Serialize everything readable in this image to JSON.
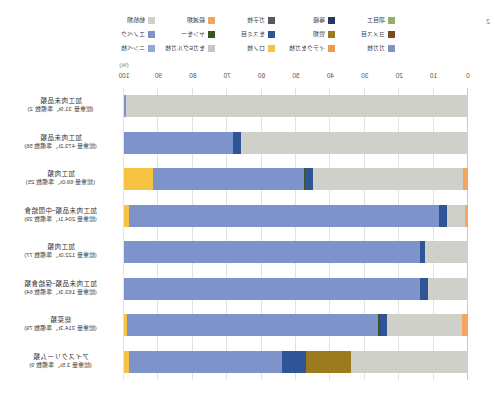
{
  "figure": {
    "corner_number": "2",
    "unit": "(%)"
  },
  "chart_data": {
    "type": "bar",
    "title": "",
    "xlabel": "(%)",
    "ylabel": "",
    "xlim": [
      0,
      100
    ],
    "grid": true,
    "stacked": true,
    "orientation": "horizontal",
    "legend_position": "top",
    "axis_ticks": [
      "0",
      "10",
      "20",
      "30",
      "40",
      "50",
      "60",
      "70",
      "80",
      "90",
      "100"
    ],
    "series": [
      {
        "name": "項目エ",
        "color": "#8fb36a",
        "values": [
          0.0,
          0.0,
          0.0,
          0.0,
          0.0,
          0.0,
          0.0,
          0.0
        ]
      },
      {
        "name": "等級",
        "color": "#1f3864",
        "values": [
          0.0,
          0.0,
          0.0,
          0.0,
          0.0,
          0.0,
          0.0,
          0.0
        ]
      },
      {
        "name": "ガ子枝",
        "color": "#595959",
        "values": [
          0.0,
          0.0,
          0.0,
          0.0,
          0.0,
          0.0,
          0.0,
          0.0
        ]
      },
      {
        "name": "殺滅類",
        "color": "#f4a45e",
        "values": [
          0.0,
          0.0,
          1.5,
          1.0,
          0.0,
          0.0,
          1.6,
          0.0
        ]
      },
      {
        "name": "動植類",
        "color": "#d0d0ca",
        "values": [
          99.4,
          66.0,
          43.5,
          5.0,
          12.5,
          11.5,
          22.0,
          34.0
        ]
      },
      {
        "name": "ヨメス目",
        "color": "#7b4b22",
        "values": [
          0.0,
          0.0,
          0.0,
          0.0,
          0.0,
          0.0,
          0.0,
          0.0
        ]
      },
      {
        "name": "管類",
        "color": "#9c7a1e",
        "values": [
          0.0,
          0.0,
          0.0,
          0.0,
          0.0,
          0.0,
          0.0,
          13.0
        ]
      },
      {
        "name": "をスミ目",
        "color": "#2f5597",
        "values": [
          0.0,
          2.2,
          2.3,
          2.5,
          1.5,
          2.5,
          2.0,
          7.0
        ]
      },
      {
        "name": "ヤンをー",
        "color": "#375623",
        "values": [
          0.0,
          0.0,
          0.5,
          0.0,
          0.0,
          0.0,
          0.5,
          0.0
        ]
      },
      {
        "name": "エノベク",
        "color": "#7d93c9",
        "values": [
          0.6,
          31.8,
          43.7,
          90.0,
          86.0,
          86.0,
          73.0,
          44.5
        ]
      },
      {
        "name": "ガガ枝",
        "color": "#7d93c9",
        "values": [
          0.0,
          0.0,
          0.0,
          0.0,
          0.0,
          0.0,
          0.0,
          0.0
        ]
      },
      {
        "name": "イテクをガ枝",
        "color": "#ed9a4a",
        "values": [
          0.0,
          0.0,
          0.0,
          0.0,
          0.0,
          0.0,
          0.0,
          0.0
        ]
      },
      {
        "name": "ロノ枝",
        "color": "#f5c242",
        "values": [
          0.0,
          0.0,
          8.5,
          1.5,
          0.0,
          0.0,
          0.9,
          1.5
        ]
      },
      {
        "name": "をガEグルガ枝",
        "color": "#c6c6c6",
        "values": [
          0.0,
          0.0,
          0.0,
          0.0,
          0.0,
          0.0,
          0.0,
          0.0
        ]
      },
      {
        "name": "ニンベ枝",
        "color": "#8fa8d8",
        "values": [
          0.0,
          0.0,
          0.0,
          0.0,
          0.0,
          0.0,
          0.0,
          0.0
        ]
      }
    ],
    "categories": [
      {
        "name": "加工肉未品類",
        "detail": "(総重量 31.9t、準備数 2)"
      },
      {
        "name": "加工肉未品類",
        "detail": "(総重量 473.2t、準備数 56)"
      },
      {
        "name": "加工肉類",
        "detail": "(総重量 69.0t、準備数 25)"
      },
      {
        "name": "加工肉未品類~中間給食",
        "detail": "(総重量 204.1t、準備数 39)"
      },
      {
        "name": "加工肉類",
        "detail": "(総重量 122.0t、準備数 77)"
      },
      {
        "name": "加工肉未品類~保給食類",
        "detail": "(総重量 163.3t、準備数 64)"
      },
      {
        "name": "総菜類",
        "detail": "(総重量 314.3t、準備数 79)"
      },
      {
        "name": "アイスクリーム類",
        "detail": "(総重量 3.5t、準備数 9)"
      }
    ]
  }
}
